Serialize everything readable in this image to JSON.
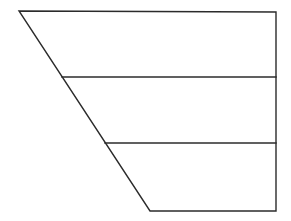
{
  "diagram": {
    "type": "segmented-trapezoid",
    "canvas": {
      "width": 291,
      "height": 221
    },
    "colors": {
      "background": "#ffffff",
      "stroke": "#2b2b2b"
    },
    "outline": {
      "top_left": [
        19,
        11
      ],
      "top_right": [
        276,
        12
      ],
      "bottom_right": [
        276,
        211
      ],
      "bottom_left": [
        150,
        211
      ]
    },
    "dividers": [
      {
        "left": [
          62,
          77
        ],
        "right": [
          276,
          77
        ]
      },
      {
        "left": [
          105,
          143
        ],
        "right": [
          276,
          143
        ]
      }
    ],
    "sections": [
      {
        "index": 1,
        "label": ""
      },
      {
        "index": 2,
        "label": ""
      },
      {
        "index": 3,
        "label": ""
      }
    ]
  }
}
